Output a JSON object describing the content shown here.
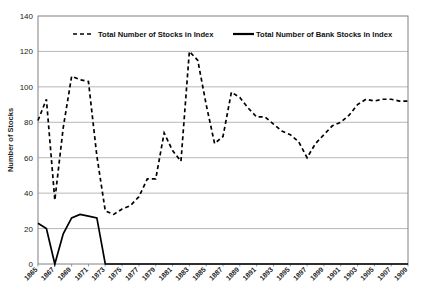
{
  "chart_data": {
    "type": "line",
    "title": "",
    "xlabel": "",
    "ylabel": "Number of Stocks",
    "ylim": [
      0,
      140
    ],
    "yticks": [
      0,
      20,
      40,
      60,
      80,
      100,
      120,
      140
    ],
    "grid": true,
    "legend_position": "top-inside",
    "xlim": [
      1865,
      1909
    ],
    "x": [
      1865,
      1866,
      1867,
      1868,
      1869,
      1870,
      1871,
      1872,
      1873,
      1874,
      1875,
      1876,
      1877,
      1878,
      1879,
      1880,
      1881,
      1882,
      1883,
      1884,
      1885,
      1886,
      1887,
      1888,
      1889,
      1890,
      1891,
      1892,
      1893,
      1894,
      1895,
      1896,
      1897,
      1898,
      1899,
      1900,
      1901,
      1902,
      1903,
      1904,
      1905,
      1906,
      1907,
      1908,
      1909
    ],
    "xticks": [
      1865,
      1867,
      1869,
      1871,
      1873,
      1875,
      1877,
      1879,
      1881,
      1883,
      1885,
      1887,
      1889,
      1891,
      1893,
      1895,
      1897,
      1899,
      1901,
      1903,
      1905,
      1907,
      1909
    ],
    "xtick_labels": [
      "1865",
      "1867",
      "1869",
      "1871",
      "1873",
      "1875",
      "1877",
      "1879",
      "1881",
      "1883",
      "1885",
      "1887",
      "1889",
      "1891",
      "1893",
      "1895",
      "1897",
      "1899",
      "1901",
      "1903",
      "1905",
      "1907",
      "1909"
    ],
    "series": [
      {
        "name": "Total Number of Stocks in Index",
        "style": "dashed",
        "color": "#000000",
        "values": [
          81,
          93,
          36,
          77,
          106,
          104,
          103,
          61,
          30,
          28,
          31,
          33,
          38,
          48,
          48,
          74,
          64,
          58,
          120,
          115,
          90,
          68,
          72,
          97,
          94,
          88,
          83,
          83,
          79,
          75,
          73,
          69,
          60,
          68,
          73,
          78,
          80,
          84,
          90,
          93,
          92,
          93,
          93,
          92,
          92
        ]
      },
      {
        "name": "Total Number of Bank Stocks in Index",
        "style": "solid",
        "color": "#000000",
        "values": [
          23,
          20,
          0,
          17,
          26,
          28,
          27,
          26,
          0,
          0,
          0,
          0,
          0,
          0,
          0,
          0,
          0,
          0,
          0,
          0,
          0,
          0,
          0,
          0,
          0,
          0,
          0,
          0,
          0,
          0,
          0,
          0,
          0,
          0,
          0,
          0,
          0,
          0,
          0,
          0,
          0,
          0,
          0,
          0,
          0
        ]
      }
    ]
  },
  "legend": {
    "items": [
      {
        "label": "Total Number of Stocks in Index",
        "style": "dashed"
      },
      {
        "label": "Total Number of Bank Stocks in Index",
        "style": "solid"
      }
    ]
  },
  "axes": {
    "y_title": "Number of Stocks"
  }
}
